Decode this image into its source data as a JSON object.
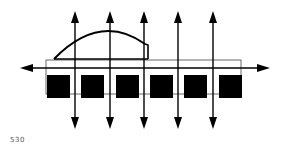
{
  "figure": {
    "label": "530",
    "colors": {
      "ink": "#000000",
      "thin_line": "#444444",
      "background": "#ffffff"
    },
    "horizontal_axis": {
      "y": 68,
      "x_start": 22,
      "x_end": 268
    },
    "bar": {
      "x": 46,
      "y": 60,
      "width": 195,
      "height": 34
    },
    "squares": [
      {
        "x": 47,
        "y": 75,
        "size": 23
      },
      {
        "x": 81,
        "y": 75,
        "size": 23
      },
      {
        "x": 116,
        "y": 75,
        "size": 23
      },
      {
        "x": 150,
        "y": 75,
        "size": 23
      },
      {
        "x": 184,
        "y": 75,
        "size": 23
      },
      {
        "x": 219,
        "y": 75,
        "size": 23
      }
    ],
    "vertical_arrows_x": [
      75,
      110,
      144,
      178,
      213
    ],
    "vertical_arrow_range": [
      12,
      128
    ]
  }
}
